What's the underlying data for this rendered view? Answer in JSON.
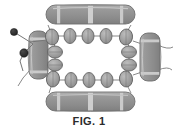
{
  "figure": {
    "caption": "FIG. 1",
    "canvas": {
      "width": 178,
      "height": 139
    },
    "background_color": "#ffffff",
    "palette": {
      "bar_fill": "#8e8e8e",
      "bar_fill_light": "#a8a8a8",
      "bar_band": "#c9c9c9",
      "bar_stroke": "#6a6a6a",
      "link_fill": "#9a9a9a",
      "link_stroke": "#5f5f5f",
      "node_fill": "#2a2a2a",
      "thread_stroke": "#7a7a7a",
      "outline_stroke": "#8c8c8c",
      "caption_color": "#2b2b2b"
    },
    "bars": [
      {
        "id": "bar-top",
        "name": "top-bar-member",
        "orientation": "horizontal",
        "x": 46,
        "y": 5,
        "width": 89,
        "height": 19,
        "band_positions": [
          0.13,
          0.52,
          0.86
        ]
      },
      {
        "id": "bar-bottom",
        "name": "bottom-bar-member",
        "orientation": "horizontal",
        "x": 46,
        "y": 92,
        "width": 89,
        "height": 19,
        "band_positions": [
          0.13,
          0.52,
          0.86
        ]
      },
      {
        "id": "bar-left",
        "name": "left-bar-member",
        "orientation": "vertical",
        "x": 29,
        "y": 31,
        "width": 19,
        "height": 48,
        "band_positions": [
          0.14,
          0.84
        ]
      },
      {
        "id": "bar-right",
        "name": "right-bar-member",
        "orientation": "vertical",
        "x": 140,
        "y": 33,
        "width": 20,
        "height": 48,
        "band_positions": [
          0.14,
          0.84
        ]
      }
    ],
    "link_chains": [
      {
        "id": "chain-top",
        "name": "top-link-chain",
        "count": 5,
        "links": [
          {
            "cx": 52,
            "cy": 37,
            "rx": 6.5,
            "ry": 8.0,
            "rot": -8
          },
          {
            "cx": 70,
            "cy": 36,
            "rx": 6.0,
            "ry": 7.5,
            "rot": 0
          },
          {
            "cx": 88,
            "cy": 36,
            "rx": 6.0,
            "ry": 7.5,
            "rot": 0
          },
          {
            "cx": 106,
            "cy": 36,
            "rx": 6.0,
            "ry": 7.5,
            "rot": 0
          },
          {
            "cx": 126,
            "cy": 37,
            "rx": 6.5,
            "ry": 8.0,
            "rot": 8
          }
        ]
      },
      {
        "id": "chain-bottom",
        "name": "bottom-link-chain",
        "count": 5,
        "links": [
          {
            "cx": 53,
            "cy": 79,
            "rx": 6.5,
            "ry": 8.0,
            "rot": 8
          },
          {
            "cx": 71,
            "cy": 80,
            "rx": 6.0,
            "ry": 7.5,
            "rot": 0
          },
          {
            "cx": 89,
            "cy": 80,
            "rx": 6.0,
            "ry": 7.5,
            "rot": 0
          },
          {
            "cx": 107,
            "cy": 80,
            "rx": 6.0,
            "ry": 7.5,
            "rot": 0
          },
          {
            "cx": 126,
            "cy": 79,
            "rx": 6.5,
            "ry": 8.0,
            "rot": -8
          }
        ]
      },
      {
        "id": "chain-left",
        "name": "left-link-chain",
        "count": 2,
        "links": [
          {
            "cx": 55,
            "cy": 52,
            "rx": 7.5,
            "ry": 6.0,
            "rot": 0
          },
          {
            "cx": 55,
            "cy": 65,
            "rx": 7.5,
            "ry": 6.0,
            "rot": 0
          }
        ]
      },
      {
        "id": "chain-right",
        "name": "right-link-chain",
        "count": 2,
        "links": [
          {
            "cx": 129,
            "cy": 52,
            "rx": 7.5,
            "ry": 6.0,
            "rot": 0
          },
          {
            "cx": 129,
            "cy": 65,
            "rx": 7.5,
            "ry": 6.0,
            "rot": 0
          }
        ]
      }
    ],
    "nodes": [
      {
        "id": "node-upper",
        "name": "upper-anchor-node",
        "cx": 14,
        "cy": 32,
        "r": 3.6
      },
      {
        "id": "node-lower",
        "name": "lower-anchor-node",
        "cx": 24,
        "cy": 53,
        "r": 4.2
      }
    ],
    "tethers": [
      {
        "id": "tether-upper",
        "name": "upper-tether-line",
        "d": "M 14 32 L 30 42"
      },
      {
        "id": "tether-lower",
        "name": "lower-tether-line",
        "d": "M 24 53 L 32 44 L 30 42"
      },
      {
        "id": "tether-lower-tail",
        "name": "lower-tether-tail",
        "d": "M 24 53 L 20 60 L 22 70"
      },
      {
        "id": "tether-bridge",
        "name": "anchor-bridge-line",
        "d": "M 30 42 L 47 40"
      }
    ]
  }
}
